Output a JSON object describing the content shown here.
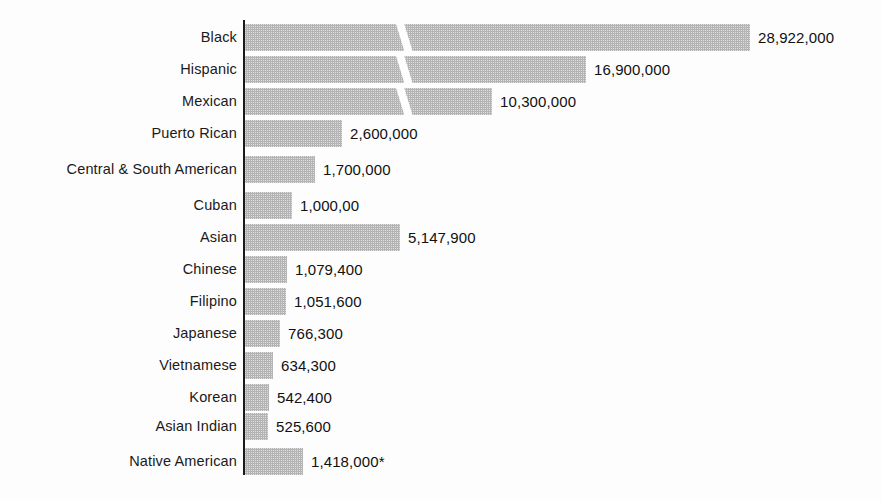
{
  "chart_data": {
    "type": "bar",
    "orientation": "horizontal",
    "title": "",
    "subtitle": "",
    "xlabel": "",
    "ylabel": "",
    "grid": false,
    "legend": null,
    "axis_broken": true,
    "note": "* Native American bar is drawn at an exaggerated scale relative to its value.",
    "categories": [
      "Black",
      "Hispanic",
      "Mexican",
      "Puerto Rican",
      "Central & South American",
      "Cuban",
      "Asian",
      "Chinese",
      "Filipino",
      "Japanese",
      "Vietnamese",
      "Korean",
      "Asian Indian",
      "Native American"
    ],
    "values": [
      28922000,
      16900000,
      10300000,
      2600000,
      1700000,
      1000000,
      5147900,
      1079400,
      1051600,
      766300,
      634300,
      542400,
      525600,
      1418000
    ],
    "value_labels": [
      "28,922,000",
      "16,900,000",
      "10,300,000",
      "2,600,000",
      "1,700,000",
      "1,000,00",
      "5,147,900",
      "1,079,400",
      "1,051,600",
      "766,300",
      "634,300",
      "542,400",
      "525,600",
      "1,418,000*"
    ]
  },
  "rows": [
    {
      "label": "Black",
      "value_label": "28,922,000",
      "top": 24,
      "bar_width": 505,
      "broken": true,
      "break_x": 150,
      "gap_after": 5
    },
    {
      "label": "Hispanic",
      "value_label": "16,900,000",
      "top": 56,
      "bar_width": 341,
      "broken": true,
      "break_x": 150,
      "gap_after": 5
    },
    {
      "label": "Mexican",
      "value_label": "10,300,000",
      "top": 88,
      "bar_width": 247,
      "broken": true,
      "break_x": 150,
      "gap_after": 5
    },
    {
      "label": "Puerto Rican",
      "value_label": "2,600,000",
      "top": 120,
      "bar_width": 97,
      "broken": false,
      "break_x": 0,
      "gap_after": 5
    },
    {
      "label": "Central & South American",
      "value_label": "1,700,000",
      "top": 156,
      "bar_width": 70,
      "broken": false,
      "break_x": 0,
      "gap_after": 5
    },
    {
      "label": "Cuban",
      "value_label": "1,000,00",
      "top": 192,
      "bar_width": 47,
      "broken": false,
      "break_x": 0,
      "gap_after": 5
    },
    {
      "label": "Asian",
      "value_label": "5,147,900",
      "top": 224,
      "bar_width": 155,
      "broken": false,
      "break_x": 0,
      "gap_after": 5
    },
    {
      "label": "Chinese",
      "value_label": "1,079,400",
      "top": 256,
      "bar_width": 42,
      "broken": false,
      "break_x": 0,
      "gap_after": 5
    },
    {
      "label": "Filipino",
      "value_label": "1,051,600",
      "top": 288,
      "bar_width": 41,
      "broken": false,
      "break_x": 0,
      "gap_after": 5
    },
    {
      "label": "Japanese",
      "value_label": "766,300",
      "top": 320,
      "bar_width": 35,
      "broken": false,
      "break_x": 0,
      "gap_after": 5
    },
    {
      "label": "Vietnamese",
      "value_label": "634,300",
      "top": 352,
      "bar_width": 28,
      "broken": false,
      "break_x": 0,
      "gap_after": 5
    },
    {
      "label": "Korean",
      "value_label": "542,400",
      "top": 384,
      "bar_width": 24,
      "broken": false,
      "break_x": 0,
      "gap_after": 5
    },
    {
      "label": "Asian Indian",
      "value_label": "525,600",
      "top": 413,
      "bar_width": 23,
      "broken": false,
      "break_x": 0,
      "gap_after": 5
    },
    {
      "label": "Native American",
      "value_label": "1,418,000*",
      "top": 448,
      "bar_width": 58,
      "broken": false,
      "break_x": 0,
      "gap_after": 0
    }
  ],
  "style": {
    "bar_color": "#b4b4b4",
    "axis_color": "#1a1a1a",
    "text_color": "#111111",
    "background": "#fdfdfd"
  }
}
